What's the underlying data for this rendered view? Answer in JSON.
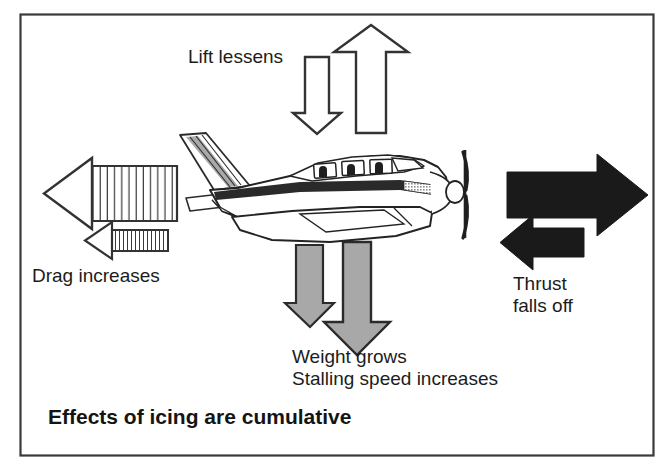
{
  "figure": {
    "kind": "aviation-safety-diagram",
    "border_color": "#3a3a3a",
    "background_color": "#ffffff"
  },
  "labels": {
    "lift": "Lift lessens",
    "drag": "Drag increases",
    "thrust_line1": "Thrust",
    "thrust_line2": "falls off",
    "weight_line1": "Weight grows",
    "weight_line2": "Stalling speed increases",
    "caption": "Effects of icing are cumulative"
  },
  "forces": [
    {
      "name": "lift",
      "label": "Lift lessens",
      "direction": "up",
      "nominal_arrow": "large outlined up arrow",
      "degraded_arrow": "small outlined down arrow",
      "style": "outline",
      "fill": "#ffffff",
      "stroke": "#333333"
    },
    {
      "name": "drag",
      "label": "Drag increases",
      "direction": "left",
      "nominal_arrow": "large hatched left arrow",
      "degraded_arrow": "small hatched left arrow",
      "style": "hatched",
      "fill": "#ffffff",
      "stroke": "#333333"
    },
    {
      "name": "thrust",
      "label": "Thrust falls off",
      "direction": "right",
      "nominal_arrow": "large solid right arrow",
      "degraded_arrow": "small solid left arrow",
      "style": "solid",
      "fill": "#1a1a1a",
      "stroke": "#1a1a1a"
    },
    {
      "name": "weight",
      "label": "Weight grows / Stalling speed increases",
      "direction": "down",
      "nominal_arrow": "small gray down arrow",
      "degraded_arrow": "large gray down arrow",
      "style": "gray-fill",
      "fill": "#a8a8a8",
      "stroke": "#2b2b2b"
    }
  ],
  "aircraft": {
    "name": "single-engine-light-airplane",
    "view": "side profile, nose right",
    "features": [
      "swept tail fin",
      "horizontal stabilizer",
      "low wing",
      "three cabin windows",
      "three passenger silhouettes",
      "two-blade propeller",
      "spinner"
    ],
    "window_count": 3
  },
  "colors": {
    "ink": "#1c1c1c",
    "outline": "#333333",
    "gray_fill": "#a8a8a8",
    "solid_black": "#1a1a1a",
    "border": "#3a3a3a",
    "paper": "#ffffff"
  }
}
